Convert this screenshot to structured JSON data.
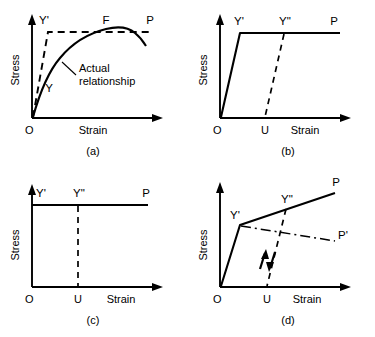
{
  "figure": {
    "axis_labels": {
      "y": "Stress",
      "x": "Strain",
      "origin": "O"
    }
  },
  "panels": [
    {
      "id": "a",
      "caption": "(a)",
      "description": "Actual stress-strain curve with elastic-perfectly-plastic idealization",
      "axis_y": "Stress",
      "axis_x": "Strain",
      "origin": "O",
      "points": [
        {
          "name": "Y-prime",
          "label": "Y'"
        },
        {
          "name": "F",
          "label": "F"
        },
        {
          "name": "P",
          "label": "P"
        },
        {
          "name": "Y",
          "label": "Y"
        }
      ],
      "annotation": {
        "line1": "Actual",
        "line2": "relationship"
      }
    },
    {
      "id": "b",
      "caption": "(b)",
      "description": "Elastic-perfectly-plastic idealization with elastic unloading",
      "axis_y": "Stress",
      "axis_x": "Strain",
      "origin": "O",
      "points": [
        {
          "name": "Y-prime",
          "label": "Y'"
        },
        {
          "name": "Y-double-prime",
          "label": "Y\""
        },
        {
          "name": "P",
          "label": "P"
        },
        {
          "name": "U",
          "label": "U"
        }
      ]
    },
    {
      "id": "c",
      "caption": "(c)",
      "description": "Rigid-perfectly-plastic idealization",
      "axis_y": "Stress",
      "axis_x": "Strain",
      "origin": "O",
      "points": [
        {
          "name": "Y-prime",
          "label": "Y'"
        },
        {
          "name": "Y-double-prime",
          "label": "Y\""
        },
        {
          "name": "P",
          "label": "P"
        },
        {
          "name": "U",
          "label": "U"
        }
      ]
    },
    {
      "id": "d",
      "caption": "(d)",
      "description": "Elastic-plastic idealization with strain hardening and strain softening branches",
      "axis_y": "Stress",
      "axis_x": "Strain",
      "origin": "O",
      "points": [
        {
          "name": "Y-prime",
          "label": "Y'"
        },
        {
          "name": "Y-double-prime",
          "label": "Y\""
        },
        {
          "name": "P",
          "label": "P"
        },
        {
          "name": "P-prime",
          "label": "P'"
        },
        {
          "name": "U",
          "label": "U"
        }
      ]
    }
  ]
}
